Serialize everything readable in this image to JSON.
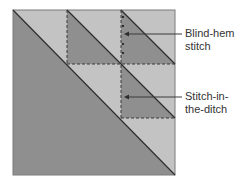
{
  "diagram": {
    "colors": {
      "dark": "#8f8f8f",
      "light": "#c3c3c3",
      "outline": "#3a3a3a",
      "background": "#ffffff"
    },
    "labels": [
      {
        "id": "blind-hem",
        "line1": "Blind-hem",
        "line2": "stitch"
      },
      {
        "id": "stitch-in-ditch",
        "line1": "Stitch-in-",
        "line2": "the-ditch"
      }
    ]
  }
}
